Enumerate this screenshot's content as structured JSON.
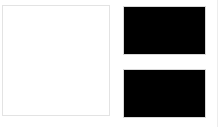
{
  "layout": {
    "main_panel": {
      "label": "",
      "background": "#ffffff",
      "border_color": "#e3e3e3"
    },
    "thumbnails": [
      {
        "label": "",
        "fill": "#000000"
      },
      {
        "label": "",
        "fill": "#000000"
      }
    ],
    "divider_color": "#ededed"
  }
}
